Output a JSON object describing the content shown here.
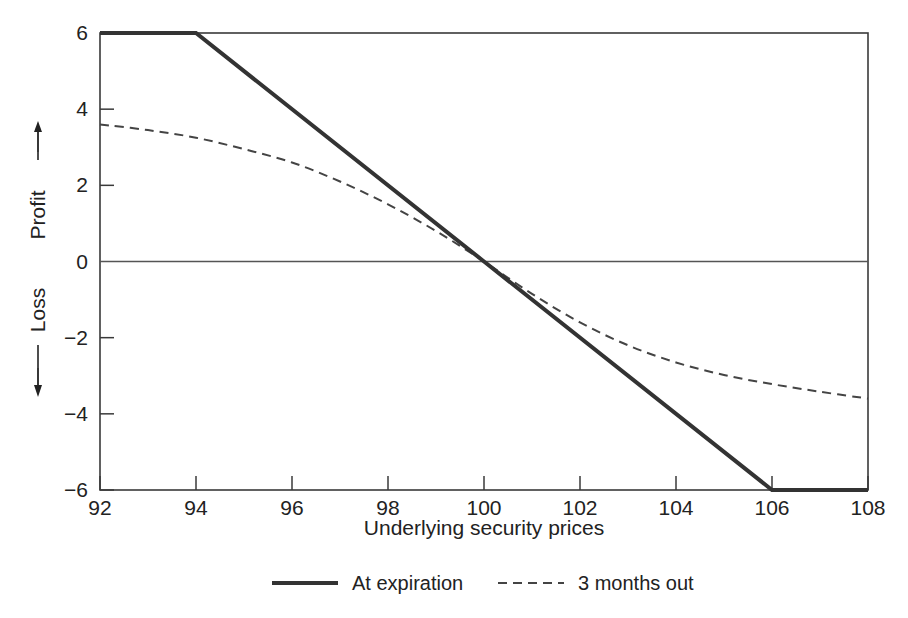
{
  "chart_data": {
    "type": "line",
    "title": "",
    "xlabel": "Underlying security prices",
    "ylabel": "Loss / Profit",
    "ylabel_upper": "Profit",
    "ylabel_lower": "Loss",
    "xlim": [
      92,
      108
    ],
    "ylim": [
      -6,
      6
    ],
    "xticks": [
      92,
      94,
      96,
      98,
      100,
      102,
      104,
      106,
      108
    ],
    "yticks": [
      -6,
      -4,
      -2,
      0,
      2,
      4,
      6
    ],
    "xtick_labels": [
      "92",
      "94",
      "96",
      "98",
      "100",
      "102",
      "104",
      "106",
      "108"
    ],
    "ytick_labels": [
      "−6",
      "−4",
      "−2",
      "0",
      "2",
      "4",
      "6"
    ],
    "grid": false,
    "zero_line": true,
    "legend_position": "below",
    "series": [
      {
        "name": "At expiration",
        "style": "solid",
        "color": "#333333",
        "width": 4,
        "x": [
          92,
          94,
          100,
          106,
          108
        ],
        "values": [
          6,
          6,
          0,
          -6,
          -6
        ]
      },
      {
        "name": "3 months out",
        "style": "dashed",
        "color": "#444444",
        "width": 2,
        "x": [
          92,
          93,
          94,
          95,
          96,
          97,
          98,
          99,
          100,
          101,
          102,
          103,
          104,
          105,
          106,
          107,
          108
        ],
        "values": [
          3.6,
          3.45,
          3.25,
          2.95,
          2.6,
          2.1,
          1.5,
          0.8,
          0.0,
          -0.85,
          -1.6,
          -2.2,
          -2.65,
          -2.98,
          -3.22,
          -3.42,
          -3.6
        ]
      }
    ]
  },
  "axis": {
    "x_title": "Underlying security prices",
    "y_profit": "Profit",
    "y_loss": "Loss"
  },
  "legend": {
    "items": [
      {
        "label": "At expiration",
        "style": "solid"
      },
      {
        "label": "3 months out",
        "style": "dashed"
      }
    ]
  },
  "colors": {
    "frame": "#3a3a3a",
    "solid_series": "#333333",
    "dashed_series": "#444444",
    "zero_line": "#555555",
    "text": "#222222",
    "background": "#ffffff"
  }
}
